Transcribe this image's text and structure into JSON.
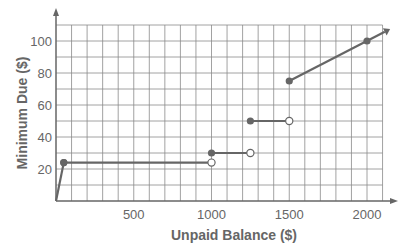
{
  "chart_data": {
    "type": "line",
    "title": "",
    "xlabel": "Unpaid Balance ($)",
    "ylabel": "Minimum Due ($)",
    "xlim": [
      0,
      2100
    ],
    "ylim": [
      0,
      110
    ],
    "x_ticks": [
      500,
      1000,
      1500,
      2000
    ],
    "y_ticks": [
      20,
      40,
      60,
      80,
      100
    ],
    "grid": true,
    "grid_step_x": 100,
    "grid_step_y": 10,
    "series": [
      {
        "name": "segment-1",
        "points": [
          [
            0,
            0
          ],
          [
            50,
            24
          ]
        ],
        "start": "none",
        "end": "closed"
      },
      {
        "name": "segment-2",
        "points": [
          [
            50,
            24
          ],
          [
            1000,
            24
          ]
        ],
        "start": "closed",
        "end": "open"
      },
      {
        "name": "segment-3",
        "points": [
          [
            1000,
            30
          ],
          [
            1250,
            30
          ]
        ],
        "start": "closed",
        "end": "open"
      },
      {
        "name": "segment-4",
        "points": [
          [
            1250,
            50
          ],
          [
            1500,
            50
          ]
        ],
        "start": "closed",
        "end": "open"
      },
      {
        "name": "segment-5",
        "points": [
          [
            1500,
            75
          ],
          [
            2000,
            100
          ]
        ],
        "start": "closed",
        "end": "arrow",
        "marked_points": [
          [
            2000,
            100
          ]
        ]
      }
    ],
    "colors": {
      "line": "#666666",
      "grid": "#8a8a8a",
      "text": "#666666"
    }
  }
}
